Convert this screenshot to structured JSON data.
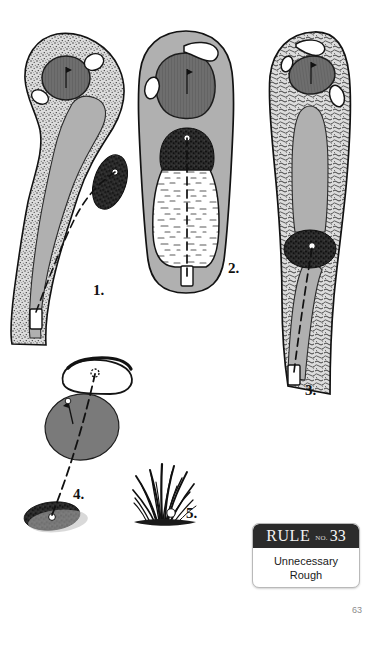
{
  "page": {
    "page_number": "63",
    "background_color": "#ffffff"
  },
  "rule_badge": {
    "rule_word": "RULE",
    "no_label": "NO.",
    "rule_number": "33",
    "title_line_1": "Unnecessary",
    "title_line_2": "Rough",
    "header_color": "#2b2b2b",
    "body_color": "#ffffff",
    "border_color": "#b9b9b9"
  },
  "diagrams": {
    "colors": {
      "fairway": "#b0b0b0",
      "green": "#6e6e6e",
      "rough_light": "#d8d8d8",
      "rough_dark": "#2e2e2e",
      "bunker": "#ffffff",
      "outline": "#1a1a1a",
      "water": "#ffffff"
    },
    "items": [
      {
        "number": "1.",
        "caption_x": 93,
        "caption_y": 283,
        "description": "dogleg hole with stippled rough border, green at top with flag, dark rough patch mid-fairway, tee box at bottom left"
      },
      {
        "number": "2.",
        "caption_x": 228,
        "caption_y": 261,
        "description": "straight hole with green at top, dark rough band then large white waste/water area, dashed centerline to tee box"
      },
      {
        "number": "3.",
        "caption_x": 305,
        "caption_y": 383,
        "description": "long straight hole with heavy rough both sides, dark rough patch with ball mid-hole, tee box at bottom"
      },
      {
        "number": "4.",
        "caption_x": 73,
        "caption_y": 487,
        "description": "close-up of green with flag and ball, dashed line down to a dark rough patch containing a ball"
      },
      {
        "number": "5.",
        "caption_x": 186,
        "caption_y": 506,
        "description": "tuft of tall grass with a golf ball nestled at its base"
      }
    ]
  }
}
